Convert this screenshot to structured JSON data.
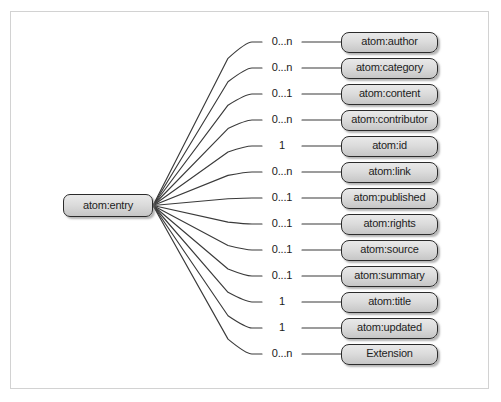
{
  "diagram": {
    "type": "tree",
    "frame": {
      "border_color": "#d2d2d2",
      "background": "#ffffff"
    },
    "style": {
      "node_fill_top": "#e9e9e9",
      "node_fill_bottom": "#c6c6c6",
      "node_border": "#2b2b2b",
      "edge_color": "#3a3a3a",
      "text_color": "#1d1d1d"
    },
    "root": {
      "label": "atom:entry"
    },
    "children": [
      {
        "label": "atom:author",
        "cardinality": "0...n"
      },
      {
        "label": "atom:category",
        "cardinality": "0...n"
      },
      {
        "label": "atom:content",
        "cardinality": "0...1"
      },
      {
        "label": "atom:contributor",
        "cardinality": "0...n"
      },
      {
        "label": "atom:id",
        "cardinality": "1"
      },
      {
        "label": "atom:link",
        "cardinality": "0...n"
      },
      {
        "label": "atom:published",
        "cardinality": "0...1"
      },
      {
        "label": "atom:rights",
        "cardinality": "0...1"
      },
      {
        "label": "atom:source",
        "cardinality": "0...1"
      },
      {
        "label": "atom:summary",
        "cardinality": "0...1"
      },
      {
        "label": "atom:title",
        "cardinality": "1"
      },
      {
        "label": "atom:updated",
        "cardinality": "1"
      },
      {
        "label": "Extension",
        "cardinality": "0...n"
      }
    ]
  }
}
